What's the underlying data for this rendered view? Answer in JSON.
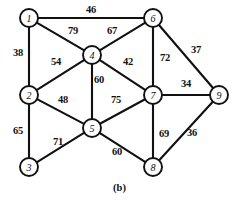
{
  "figure": {
    "caption": "(b)",
    "width": 239,
    "height": 202,
    "background_color": "#ffffff",
    "stroke_color": "#111111"
  },
  "chart_data": {
    "type": "diagram",
    "subtype": "weighted-undirected-graph",
    "title": "(b)",
    "xlabel": "",
    "ylabel": "",
    "node_radius": 9,
    "nodes": [
      {
        "id": "1",
        "label": "1",
        "x": 29,
        "y": 18
      },
      {
        "id": "2",
        "label": "2",
        "x": 29,
        "y": 95
      },
      {
        "id": "3",
        "label": "3",
        "x": 29,
        "y": 167
      },
      {
        "id": "4",
        "label": "4",
        "x": 92,
        "y": 55
      },
      {
        "id": "5",
        "label": "5",
        "x": 92,
        "y": 128
      },
      {
        "id": "6",
        "label": "6",
        "x": 153,
        "y": 18
      },
      {
        "id": "7",
        "label": "7",
        "x": 153,
        "y": 95
      },
      {
        "id": "8",
        "label": "8",
        "x": 153,
        "y": 167
      },
      {
        "id": "9",
        "label": "9",
        "x": 219,
        "y": 95
      }
    ],
    "edges": [
      {
        "source": "1",
        "target": "6",
        "weight": 46,
        "label_x": 91,
        "label_y": 10
      },
      {
        "source": "1",
        "target": "2",
        "weight": 38,
        "label_x": 18,
        "label_y": 53
      },
      {
        "source": "1",
        "target": "4",
        "weight": 79,
        "label_x": 73,
        "label_y": 31
      },
      {
        "source": "4",
        "target": "6",
        "weight": 67,
        "label_x": 112,
        "label_y": 31
      },
      {
        "source": "2",
        "target": "4",
        "weight": 54,
        "label_x": 56,
        "label_y": 62
      },
      {
        "source": "4",
        "target": "5",
        "weight": 60,
        "label_x": 99,
        "label_y": 80
      },
      {
        "source": "4",
        "target": "7",
        "weight": 42,
        "label_x": 128,
        "label_y": 62
      },
      {
        "source": "6",
        "target": "7",
        "weight": 72,
        "label_x": 165,
        "label_y": 58
      },
      {
        "source": "6",
        "target": "9",
        "weight": 37,
        "label_x": 196,
        "label_y": 50
      },
      {
        "source": "7",
        "target": "9",
        "weight": 34,
        "label_x": 186,
        "label_y": 84
      },
      {
        "source": "2",
        "target": "5",
        "weight": 48,
        "label_x": 63,
        "label_y": 100
      },
      {
        "source": "5",
        "target": "7",
        "weight": 75,
        "label_x": 116,
        "label_y": 100
      },
      {
        "source": "2",
        "target": "3",
        "weight": 65,
        "label_x": 18,
        "label_y": 131
      },
      {
        "source": "3",
        "target": "5",
        "weight": 71,
        "label_x": 58,
        "label_y": 142
      },
      {
        "source": "5",
        "target": "8",
        "weight": 60,
        "label_x": 117,
        "label_y": 152
      },
      {
        "source": "7",
        "target": "8",
        "weight": 69,
        "label_x": 164,
        "label_y": 134
      },
      {
        "source": "8",
        "target": "9",
        "weight": 36,
        "label_x": 192,
        "label_y": 133
      }
    ],
    "legend": [],
    "annotations": []
  }
}
